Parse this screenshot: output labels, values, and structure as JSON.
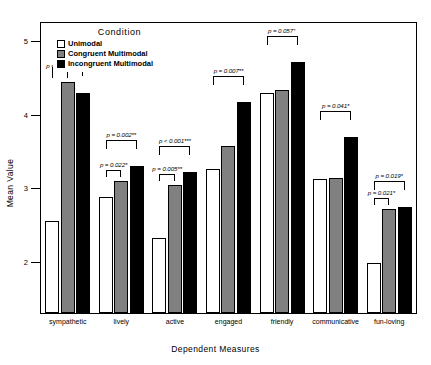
{
  "chart_data": {
    "type": "bar",
    "title": "",
    "xlabel": "Dependent Measures",
    "ylabel": "Mean Value",
    "ylim": [
      1.3,
      5.25
    ],
    "yticks": [
      2,
      3,
      4,
      5
    ],
    "ytick_labels": [
      "2",
      "3",
      "4",
      "5"
    ],
    "grid": false,
    "legend_position": "top-left",
    "legend_title": "Condition",
    "categories": [
      "sympathetic",
      "lively",
      "active",
      "engaged",
      "friendly",
      "communicative",
      "fun-loving"
    ],
    "series": [
      {
        "name": "Unimodal",
        "color": "#ffffff",
        "values": [
          2.55,
          2.88,
          2.32,
          3.26,
          4.3,
          3.12,
          1.98
        ]
      },
      {
        "name": "Congruent Multimodal",
        "color": "#808080",
        "values": [
          4.45,
          3.1,
          3.05,
          3.58,
          4.34,
          3.14,
          2.72
        ]
      },
      {
        "name": "Incongruent Multimodal",
        "color": "#000000",
        "values": [
          4.3,
          3.3,
          3.22,
          4.18,
          4.72,
          3.7,
          2.74
        ]
      }
    ],
    "annotations": [
      {
        "category": "sympathetic",
        "text": "p = 0.056⁺",
        "from": "Unimodal",
        "to": "Incongruent Multimodal"
      },
      {
        "category": "sympathetic",
        "text": "p = 0.033*",
        "from": "Unimodal",
        "to": "Congruent Multimodal"
      },
      {
        "category": "lively",
        "text": "p = 0.002**",
        "from": "Unimodal",
        "to": "Incongruent Multimodal"
      },
      {
        "category": "lively",
        "text": "p = 0.022*",
        "from": "Unimodal",
        "to": "Congruent Multimodal"
      },
      {
        "category": "active",
        "text": "p < 0.001***",
        "from": "Unimodal",
        "to": "Incongruent Multimodal"
      },
      {
        "category": "active",
        "text": "p = 0.005**",
        "from": "Unimodal",
        "to": "Congruent Multimodal"
      },
      {
        "category": "engaged",
        "text": "p = 0.007**",
        "from": "Unimodal",
        "to": "Incongruent Multimodal"
      },
      {
        "category": "friendly",
        "text": "p = 0.057⁺",
        "from": "Unimodal",
        "to": "Incongruent Multimodal"
      },
      {
        "category": "communicative",
        "text": "p = 0.041*",
        "from": "Unimodal",
        "to": "Incongruent Multimodal"
      },
      {
        "category": "fun-loving",
        "text": "p = 0.019*",
        "from": "Unimodal",
        "to": "Incongruent Multimodal"
      },
      {
        "category": "fun-loving",
        "text": "p = 0.021*",
        "from": "Unimodal",
        "to": "Congruent Multimodal"
      }
    ]
  },
  "axes": {
    "ylabel": "Mean Value",
    "xlabel": "Dependent Measures"
  },
  "legend": {
    "title": "Condition",
    "items": [
      {
        "label": "Unimodal",
        "swatch": "sw-uni"
      },
      {
        "label": "Congruent Multimodal",
        "swatch": "sw-cong"
      },
      {
        "label": "Incongruent Multimodal",
        "swatch": "sw-incong"
      }
    ]
  }
}
